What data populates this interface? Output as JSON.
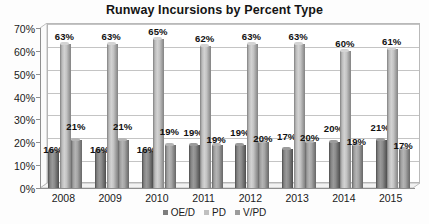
{
  "chart_data": {
    "type": "bar",
    "title": "Runway Incursions by Percent Type",
    "xlabel": "",
    "ylabel": "",
    "categories": [
      "2008",
      "2009",
      "2010",
      "2011",
      "2012",
      "2013",
      "2014",
      "2015"
    ],
    "series": [
      {
        "name": "OE/D",
        "color": "#7d7d7d",
        "values": [
          16,
          16,
          16,
          19,
          19,
          17,
          20,
          21
        ]
      },
      {
        "name": "PD",
        "color": "#c0c0c0",
        "values": [
          63,
          63,
          65,
          62,
          63,
          63,
          60,
          61
        ]
      },
      {
        "name": "V/PD",
        "color": "#9c9c9c",
        "values": [
          21,
          21,
          19,
          19,
          20,
          20,
          19,
          17
        ]
      }
    ],
    "value_labels": [
      [
        "16%",
        "16%",
        "16%",
        "19%",
        "19%",
        "17%",
        "20%",
        "21%"
      ],
      [
        "63%",
        "63%",
        "65%",
        "62%",
        "63%",
        "63%",
        "60%",
        "61%"
      ],
      [
        "21%",
        "21%",
        "19%",
        "19%",
        "20%",
        "20%",
        "19%",
        "17%"
      ]
    ],
    "ylim": [
      0,
      70
    ],
    "ytick_values": [
      0,
      10,
      20,
      30,
      40,
      50,
      60,
      70
    ],
    "ytick_labels": [
      "0%",
      "10%",
      "20%",
      "30%",
      "40%",
      "50%",
      "60%",
      "70%"
    ],
    "grid": true,
    "legend_position": "bottom",
    "chart_style": "3d-clustered-cylinder"
  },
  "legend": {
    "items": [
      {
        "label": "OE/D"
      },
      {
        "label": "PD"
      },
      {
        "label": "V/PD"
      }
    ]
  }
}
